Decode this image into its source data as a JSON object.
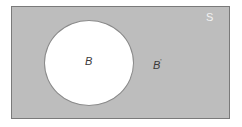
{
  "diagram": {
    "type": "venn",
    "universe_label": "S",
    "set_label": "B",
    "complement_label": "B",
    "complement_mark": "'",
    "colors": {
      "universe_fill": "#bdbdbd",
      "set_fill": "#ffffff",
      "border": "#7a7a7a"
    }
  }
}
